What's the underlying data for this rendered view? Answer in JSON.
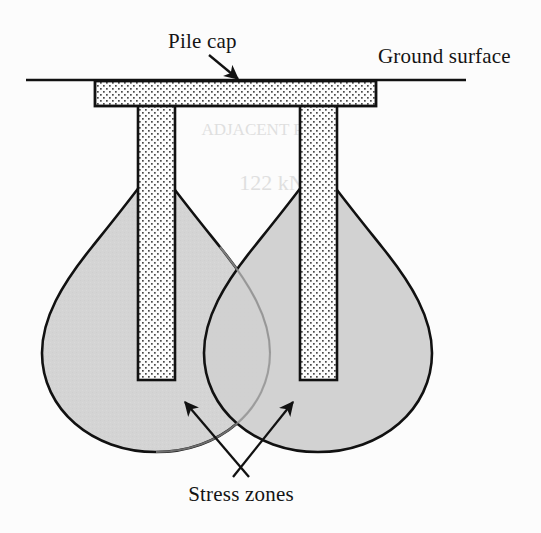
{
  "figure": {
    "name": "pile-group-stress-zones-diagram",
    "type": "engineering-cross-section-diagram",
    "background_color": "#ffffff",
    "labels": {
      "pile_cap": "Pile cap",
      "ground_surface": "Ground surface",
      "stress_zones": "Stress zones"
    },
    "colors": {
      "outline": "#111111",
      "stress_bulb_fill": "#d4d4d4",
      "stress_bulb_overlap_fill": "#c6c6c6",
      "concrete_fill": "#fdfdfd",
      "stipple_dot": "#4a4a4a",
      "ground_line": "#111111",
      "label_text": "#141414",
      "ghost_text": "#c9c9c9"
    },
    "geometry": {
      "ground_line": {
        "x1": 26,
        "y1": 80,
        "x2": 466,
        "y2": 80
      },
      "pile_cap": {
        "x": 95,
        "y": 82,
        "width": 281,
        "height": 24
      },
      "left_pile": {
        "x": 138,
        "y": 106,
        "width": 37,
        "height": 272
      },
      "right_pile": {
        "x": 300,
        "y": 106,
        "width": 37,
        "height": 272
      },
      "left_bulb_center_x": 156,
      "right_bulb_center_x": 318,
      "bulb_apex_y": 162,
      "bulb_bottom_y": 452,
      "bulb_max_half_width": 118
    },
    "annotations": {
      "pile_cap_arrow": {
        "from_x": 212,
        "from_y": 58,
        "to_x": 238,
        "to_y": 82
      },
      "stress_zone_arrow_left": {
        "from_x": 248,
        "from_y": 476,
        "to_x": 186,
        "to_y": 403
      },
      "stress_zone_arrow_right": {
        "from_x": 234,
        "from_y": 476,
        "to_x": 292,
        "to_y": 403
      }
    },
    "ghost_background_text": [
      {
        "text": "ADJACENT PILES",
        "x": 270,
        "y": 135,
        "size": 17
      },
      {
        "text": "122 kN",
        "x": 272,
        "y": 190,
        "size": 22
      }
    ]
  }
}
